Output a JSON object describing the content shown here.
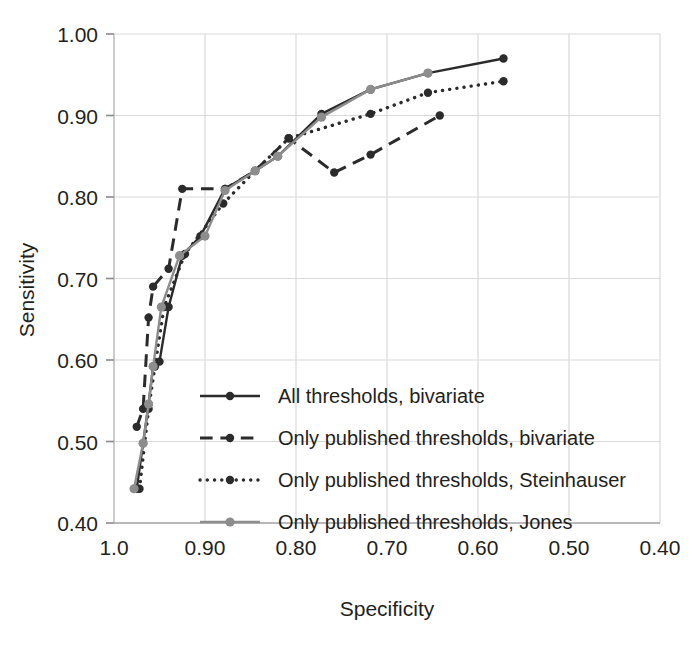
{
  "chart_data": {
    "type": "line",
    "title": "",
    "xlabel": "Specificity",
    "ylabel": "Sensitivity",
    "xlim": [
      1.0,
      0.4
    ],
    "ylim": [
      0.4,
      1.0
    ],
    "x_reversed": true,
    "grid": true,
    "legend_position": "inside-lower-right",
    "xticks": [
      "1.0",
      "0.90",
      "0.80",
      "0.70",
      "0.60",
      "0.50",
      "0.40"
    ],
    "xtick_values": [
      1.0,
      0.9,
      0.8,
      0.7,
      0.6,
      0.5,
      0.4
    ],
    "yticks": [
      "0.40",
      "0.50",
      "0.60",
      "0.70",
      "0.80",
      "0.90",
      "1.00"
    ],
    "ytick_values": [
      0.4,
      0.5,
      0.6,
      0.7,
      0.8,
      0.9,
      1.0
    ],
    "series": [
      {
        "name": "All thresholds, bivariate",
        "color": "#2b2b2b",
        "style": "solid",
        "width": 2.4,
        "marker": "circle",
        "marker_size": 4.2,
        "points": [
          [
            0.975,
            0.442
          ],
          [
            0.968,
            0.498
          ],
          [
            0.962,
            0.546
          ],
          [
            0.957,
            0.592
          ],
          [
            0.95,
            0.598
          ],
          [
            0.94,
            0.665
          ],
          [
            0.925,
            0.728
          ],
          [
            0.905,
            0.752
          ],
          [
            0.878,
            0.81
          ],
          [
            0.845,
            0.832
          ],
          [
            0.82,
            0.85
          ],
          [
            0.772,
            0.902
          ],
          [
            0.718,
            0.932
          ],
          [
            0.655,
            0.952
          ],
          [
            0.572,
            0.97
          ]
        ]
      },
      {
        "name": "Only published thresholds, bivariate",
        "color": "#2b2b2b",
        "style": "dashed",
        "width": 3.0,
        "marker": "circle",
        "marker_size": 4.2,
        "points": [
          [
            0.975,
            0.518
          ],
          [
            0.968,
            0.54
          ],
          [
            0.962,
            0.652
          ],
          [
            0.957,
            0.69
          ],
          [
            0.94,
            0.712
          ],
          [
            0.925,
            0.81
          ],
          [
            0.878,
            0.81
          ],
          [
            0.845,
            0.832
          ],
          [
            0.808,
            0.872
          ],
          [
            0.758,
            0.83
          ],
          [
            0.718,
            0.852
          ],
          [
            0.642,
            0.9
          ]
        ]
      },
      {
        "name": "Only published thresholds, Steinhauser",
        "color": "#2b2b2b",
        "style": "dotted",
        "width": 3.4,
        "marker": "circle",
        "marker_size": 4.2,
        "points": [
          [
            0.972,
            0.442
          ],
          [
            0.962,
            0.54
          ],
          [
            0.955,
            0.592
          ],
          [
            0.945,
            0.665
          ],
          [
            0.922,
            0.73
          ],
          [
            0.88,
            0.792
          ],
          [
            0.845,
            0.832
          ],
          [
            0.808,
            0.872
          ],
          [
            0.718,
            0.902
          ],
          [
            0.655,
            0.928
          ],
          [
            0.572,
            0.942
          ]
        ]
      },
      {
        "name": "Only published thresholds, Jones",
        "color": "#8d8d8d",
        "style": "solid",
        "width": 2.4,
        "marker": "circle",
        "marker_size": 4.6,
        "points": [
          [
            0.978,
            0.442
          ],
          [
            0.968,
            0.498
          ],
          [
            0.962,
            0.546
          ],
          [
            0.957,
            0.592
          ],
          [
            0.948,
            0.665
          ],
          [
            0.928,
            0.728
          ],
          [
            0.9,
            0.752
          ],
          [
            0.878,
            0.808
          ],
          [
            0.845,
            0.832
          ],
          [
            0.82,
            0.85
          ],
          [
            0.772,
            0.898
          ],
          [
            0.718,
            0.932
          ],
          [
            0.655,
            0.952
          ]
        ]
      }
    ]
  },
  "legend": {
    "items": [
      {
        "label": "All thresholds, bivariate"
      },
      {
        "label": "Only published thresholds, bivariate"
      },
      {
        "label": "Only published thresholds, Steinhauser"
      },
      {
        "label": "Only published thresholds, Jones"
      }
    ]
  },
  "colors": {
    "dark": "#2b2b2b",
    "gray": "#8d8d8d",
    "grid": "#d9d9d9",
    "text": "#231f20",
    "background": "#ffffff"
  }
}
